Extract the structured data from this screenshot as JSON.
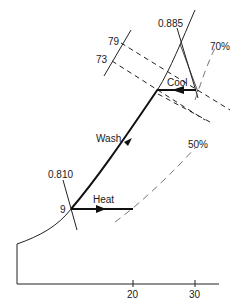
{
  "diagram": {
    "type": "psychrometric-process",
    "labels": {
      "sv_top": "0.885",
      "sv_bottom": "0.810",
      "enthalpy_79": "79",
      "enthalpy_73": "73",
      "rh_70": "70%",
      "rh_50": "50%",
      "cool": "Cool",
      "wash": "Wash",
      "heat": "Heat",
      "dew_9": "9"
    },
    "x_axis": {
      "ticks": [
        "20",
        "30"
      ]
    },
    "processes": [
      "Cool",
      "Wash",
      "Heat"
    ]
  }
}
